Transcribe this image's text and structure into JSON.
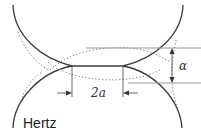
{
  "diagram": {
    "title": "Hertz",
    "labels": {
      "contact_width": "2a",
      "approach": "α"
    },
    "colors": {
      "solid_line": "#3a3a3a",
      "dotted_line": "#777777",
      "guide_line": "#9a9a9a"
    }
  }
}
